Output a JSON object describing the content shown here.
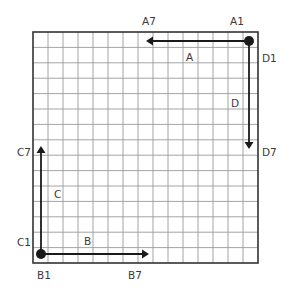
{
  "grid": {
    "cols": 15,
    "rows": 15,
    "left": 33,
    "top": 32,
    "right": 258,
    "bottom": 263,
    "grid_color": "#9a9a9a",
    "border_color": "#333333"
  },
  "arrow_color": "#1a1a1a",
  "arrows": [
    {
      "name": "A",
      "label": "A",
      "start_label": "A1",
      "end_label": "A7",
      "x1": 249,
      "y1": 41,
      "x2": 146,
      "y2": 41,
      "direction": "left"
    },
    {
      "name": "D",
      "label": "D",
      "start_label": "D1",
      "end_label": "D7",
      "x1": 249,
      "y1": 41,
      "x2": 249,
      "y2": 149,
      "direction": "down"
    },
    {
      "name": "C",
      "label": "C",
      "start_label": "C1",
      "end_label": "C7",
      "x1": 41,
      "y1": 254,
      "x2": 41,
      "y2": 146,
      "direction": "up"
    },
    {
      "name": "B",
      "label": "B",
      "start_label": "B1",
      "end_label": "B7",
      "x1": 41,
      "y1": 254,
      "x2": 149,
      "y2": 254,
      "direction": "right"
    }
  ],
  "dots": [
    {
      "name": "origin-a-d",
      "x": 249,
      "y": 41
    },
    {
      "name": "origin-b-c",
      "x": 41,
      "y": 254
    }
  ],
  "labels": {
    "A1": "A1",
    "A7": "A7",
    "A": "A",
    "D1": "D1",
    "D7": "D7",
    "D": "D",
    "C1": "C1",
    "C7": "C7",
    "C": "C",
    "B1": "B1",
    "B7": "B7",
    "B": "B"
  }
}
